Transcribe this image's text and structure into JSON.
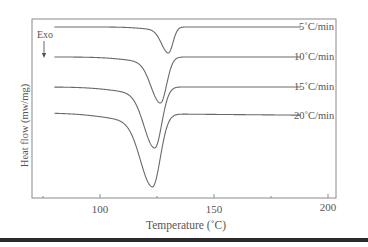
{
  "chart_data": {
    "type": "line",
    "title": "",
    "xlabel": "Temperature (°C)",
    "ylabel": "Heat flow (mw/mg)",
    "xlim": [
      70,
      205
    ],
    "x_ticks": [
      100,
      150,
      200
    ],
    "x_minor_ticks": [
      75,
      125,
      175
    ],
    "annotation": {
      "text": "Exo",
      "arrow": "down"
    },
    "grid": false,
    "legend_position": "inline-right",
    "series": [
      {
        "name": "5°C/min",
        "baseline_y_px": 27,
        "peak_T": 130,
        "peak_y_px": 53,
        "width": 2.2
      },
      {
        "name": "10°C/min",
        "baseline_y_px": 57,
        "peak_T": 126.5,
        "peak_y_px": 103,
        "width": 3.0
      },
      {
        "name": "15°C/min",
        "baseline_y_px": 87,
        "peak_T": 124,
        "peak_y_px": 148,
        "width": 3.4
      },
      {
        "name": "20°C/min",
        "baseline_y_px": 114,
        "peak_T": 123,
        "peak_y_px": 187,
        "width": 3.8
      }
    ],
    "x_start": 80,
    "x_end": 188
  },
  "labels": {
    "exo": "Exo",
    "xlabel": "Temperature (˚C)",
    "ylabel": "Heat flow (mw/mg)",
    "ticks": [
      "100",
      "150",
      "200"
    ],
    "series": [
      "5˚C/min",
      "10˚C/min",
      "15˚C/min",
      "20˚C/min"
    ]
  },
  "colors": {
    "line": "#6a6a6a",
    "frame": "#8a8a8a",
    "text": "#555555"
  }
}
